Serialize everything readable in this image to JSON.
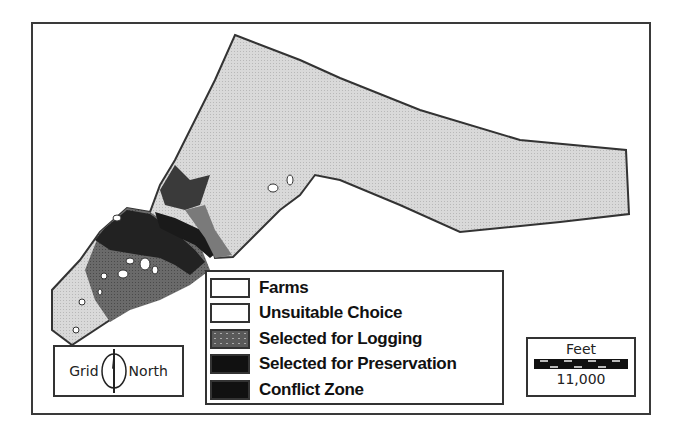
{
  "map": {
    "type": "land-use suitability map",
    "colors": {
      "farms": "#d6d6d6",
      "unsuitable": "#c9c9c9",
      "logging": "#6e6e6e",
      "preservation": "#1a1a1a",
      "conflict": "#2a2a2a",
      "outline": "#333333"
    }
  },
  "legend": {
    "items": [
      {
        "label": "Farms",
        "swatch": "#ffffff"
      },
      {
        "label": "Unsuitable Choice",
        "swatch": "#ffffff"
      },
      {
        "label": "Selected for Logging",
        "swatch": "#5a5a5a"
      },
      {
        "label": "Selected for Preservation",
        "swatch": "#111111"
      },
      {
        "label": "Conflict Zone",
        "swatch": "#111111"
      }
    ]
  },
  "north_arrow": {
    "left_label": "Grid",
    "right_label": "North",
    "icon": "north-arrow-icon"
  },
  "scale_bar": {
    "unit": "Feet",
    "value": "11,000"
  }
}
